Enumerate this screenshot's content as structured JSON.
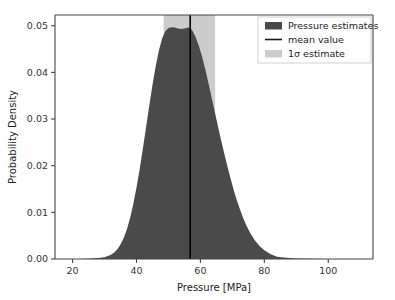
{
  "chart_data": {
    "type": "area",
    "title": "",
    "xlabel": "Pressure [MPa]",
    "ylabel": "Probability Density",
    "xlim": [
      14.5,
      114.0
    ],
    "ylim": [
      0.0,
      0.0523
    ],
    "xticks": [
      20,
      40,
      60,
      80,
      100
    ],
    "xtick_labels": [
      "20",
      "40",
      "60",
      "80",
      "100"
    ],
    "yticks": [
      0.0,
      0.01,
      0.02,
      0.03,
      0.04,
      0.05
    ],
    "ytick_labels": [
      "0.00",
      "0.01",
      "0.02",
      "0.03",
      "0.04",
      "0.05"
    ],
    "grid": false,
    "legend_position": "upper right",
    "series": [
      {
        "name": "Pressure estimates",
        "type": "area",
        "color": "#4a4a4a",
        "x": [
          14.5,
          18,
          22,
          26,
          28,
          30,
          32,
          33,
          34,
          35,
          36,
          37,
          38,
          39,
          40,
          41,
          42,
          43,
          44,
          45,
          46,
          47,
          48,
          49,
          50,
          51,
          52,
          53,
          54,
          55,
          56,
          56.8,
          57.5,
          58.5,
          59.5,
          60.5,
          61.5,
          62.5,
          63.5,
          64.5,
          65.5,
          66.5,
          67.5,
          68.5,
          69.5,
          70.5,
          71.5,
          72.5,
          73.5,
          74.5,
          75.5,
          77,
          78.5,
          80,
          82,
          84,
          86,
          88,
          90,
          94,
          100,
          108,
          114
        ],
        "y": [
          0.0,
          0.0,
          0.0,
          0.0001,
          0.0002,
          0.0004,
          0.0009,
          0.0014,
          0.0021,
          0.0031,
          0.0045,
          0.0064,
          0.0088,
          0.0118,
          0.0153,
          0.0193,
          0.0237,
          0.0283,
          0.0329,
          0.0373,
          0.0413,
          0.0447,
          0.0472,
          0.0488,
          0.0495,
          0.0497,
          0.0496,
          0.0494,
          0.0493,
          0.0494,
          0.0496,
          0.0495,
          0.0489,
          0.0476,
          0.0457,
          0.0434,
          0.0407,
          0.0377,
          0.0346,
          0.0315,
          0.0284,
          0.0254,
          0.0225,
          0.0197,
          0.0171,
          0.0146,
          0.0124,
          0.0104,
          0.0086,
          0.007,
          0.0057,
          0.004,
          0.0028,
          0.0019,
          0.001,
          0.0005,
          0.0003,
          0.0002,
          0.0001,
          5e-05,
          0.0,
          0.0,
          0.0
        ]
      }
    ],
    "annotations": {
      "mean_value": 56.8,
      "sigma_low": 48.5,
      "sigma_high": 64.6,
      "mean_line_color": "#000000",
      "sigma_band_color": "#cccccc",
      "peak_density": 0.0497,
      "peak_pressure": 51.0
    },
    "legend": [
      {
        "label": "Pressure estimates",
        "marker": "patch",
        "color": "#4a4a4a"
      },
      {
        "label": "mean value",
        "marker": "line",
        "color": "#1a1a1a"
      },
      {
        "label": "1σ estimate",
        "marker": "patch",
        "color": "#cccccc"
      }
    ]
  }
}
